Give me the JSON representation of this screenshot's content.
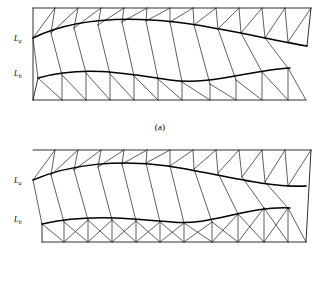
{
  "figure": {
    "panels": [
      {
        "id": "a",
        "caption": "(a)",
        "labels": {
          "upper": {
            "base": "L",
            "sub": "a",
            "text": "La"
          },
          "lower": {
            "base": "L",
            "sub": "b",
            "text": "Lb"
          }
        }
      },
      {
        "id": "b",
        "caption": "(b)",
        "labels": {
          "upper": {
            "base": "L",
            "sub": "a",
            "text": "La"
          },
          "lower": {
            "base": "L",
            "sub": "b",
            "text": "Lb"
          }
        }
      }
    ],
    "colors": {
      "background": "#ffffff",
      "line": "#1a1a1a",
      "curve": "#000000",
      "text": "#000000"
    }
  },
  "panel_a": {
    "outline": "M 33,8 L 311,8 L 307,46 L 306,100 L 33,100 Z",
    "top_boundary": "M 33,8 L 311,8",
    "right_upper": "M 311,8 L 307,46",
    "left_boundary": "M 33,8 L 33,100",
    "bottom_boundary": "M 33,100 L 306,100",
    "curve_a": "M 33,38 C 70,20 120,16 175,22 C 225,28 270,40 307,46",
    "curve_b": "M 38,78 C 80,66 120,72 170,80 C 210,86 250,70 290,68",
    "upper_strip_verticals": [
      "M 55,8 L 51,33",
      "M 78,8 L 74,28",
      "M 101,8 L 98,25",
      "M 124,8 L 122,22",
      "M 147,8 L 146,21",
      "M 170,8 L 170,22",
      "M 193,8 L 194,25",
      "M 216,8 L 218,29",
      "M 239,8 L 241,33",
      "M 262,8 L 265,38",
      "M 285,8 L 288,42"
    ],
    "upper_strip_diagonals": [
      "M 33,38 L 55,8",
      "M 51,33 L 78,8",
      "M 74,28 L 101,8",
      "M 98,25 L 124,8",
      "M 122,22 L 147,8",
      "M 146,21 L 170,8",
      "M 170,22 L 193,8",
      "M 194,25 L 216,8",
      "M 218,29 L 239,8",
      "M 241,33 L 262,8",
      "M 265,38 L 285,8",
      "M 288,42 L 311,8"
    ],
    "middle_band_lines": [
      "M 33,38 L 38,78",
      "M 51,33 L 62,75",
      "M 74,28 L 86,73",
      "M 98,25 L 110,74",
      "M 122,22 L 134,76",
      "M 146,21 L 158,79",
      "M 170,22 L 182,82",
      "M 194,25 L 210,84",
      "M 218,29 L 236,80",
      "M 241,33 L 262,72",
      "M 265,38 L 288,68",
      "M 288,42 L 307,46"
    ],
    "lower_strip_verticals": [
      "M 62,75 L 62,100",
      "M 86,73 L 86,100",
      "M 110,74 L 110,100",
      "M 134,76 L 134,100",
      "M 158,79 L 158,100",
      "M 182,82 L 182,100",
      "M 210,84 L 210,100",
      "M 236,80 L 236,100",
      "M 262,72 L 262,100",
      "M 288,68 L 288,100"
    ],
    "lower_strip_diagonals": [
      "M 38,78 L 62,100",
      "M 62,75 L 86,100",
      "M 86,73 L 110,100",
      "M 110,74 L 134,100",
      "M 134,76 L 158,100",
      "M 158,79 L 182,100",
      "M 182,82 L 210,100",
      "M 210,84 L 236,100",
      "M 236,80 L 262,100",
      "M 262,72 L 288,100",
      "M 288,68 L 306,100"
    ],
    "lower_left_closure": "M 33,100 L 38,78",
    "label_positions": {
      "upper": {
        "x": 14,
        "y": 41
      },
      "lower": {
        "x": 14,
        "y": 76
      }
    }
  },
  "panel_b": {
    "outline": "M 33,8 L 311,8 L 306,100 L 42,100 Z",
    "top_boundary": "M 33,8 L 311,8",
    "right_boundary": "M 311,8 L 306,100",
    "bottom_boundary": "M 42,100 L 306,100",
    "curve_a": "M 33,38 C 70,22 120,17 168,24 C 215,31 265,46 306,44",
    "curve_b": "M 42,82 C 85,72 125,76 172,80 C 212,84 245,64 290,66",
    "upper_strip_verticals": [
      "M 55,8 L 51,33",
      "M 78,8 L 74,28",
      "M 101,8 L 98,25",
      "M 124,8 L 122,22",
      "M 147,8 L 146,21",
      "M 170,8 L 170,24",
      "M 193,8 L 194,27",
      "M 216,8 L 218,31",
      "M 239,8 L 242,35",
      "M 262,8 L 265,40",
      "M 285,8 L 288,44"
    ],
    "upper_strip_diagonals": [
      "M 33,38 L 55,8",
      "M 51,33 L 78,8",
      "M 74,28 L 101,8",
      "M 98,25 L 124,8",
      "M 122,22 L 147,8",
      "M 146,21 L 170,8",
      "M 170,24 L 193,8",
      "M 194,27 L 216,8",
      "M 218,31 L 239,8",
      "M 242,35 L 262,8",
      "M 265,40 L 285,8",
      "M 288,44 L 311,8"
    ],
    "middle_band_lines": [
      "M 33,38 L 42,82",
      "M 51,33 L 64,80",
      "M 74,28 L 88,78",
      "M 98,25 L 112,78",
      "M 122,22 L 136,79",
      "M 146,21 L 160,80",
      "M 170,24 L 184,81",
      "M 194,27 L 212,80",
      "M 218,31 L 238,72",
      "M 242,35 L 264,66",
      "M 265,40 L 288,66",
      "M 288,44 L 306,44"
    ],
    "lower_strip_verticals": [
      "M 64,80 L 64,100",
      "M 88,78 L 88,100",
      "M 112,78 L 112,100",
      "M 136,79 L 136,100",
      "M 160,80 L 160,100",
      "M 184,81 L 184,100",
      "M 212,80 L 212,100",
      "M 238,72 L 238,100",
      "M 264,66 L 264,100",
      "M 288,66 L 288,100"
    ],
    "lower_strip_diagonals": [
      "M 42,82 L 64,100",
      "M 64,80 L 88,100",
      "M 88,78 L 112,100",
      "M 112,78 L 136,100",
      "M 136,79 L 160,100",
      "M 160,80 L 184,100",
      "M 184,81 L 212,100",
      "M 212,80 L 238,100",
      "M 238,72 L 264,100",
      "M 264,66 L 288,100",
      "M 288,66 L 306,100"
    ],
    "lower_extra_diagonals": [
      "M 64,100 L 88,78",
      "M 88,100 L 112,78",
      "M 112,100 L 136,79",
      "M 136,100 L 160,80",
      "M 160,100 L 184,81",
      "M 184,100 L 212,80",
      "M 212,100 L 238,72",
      "M 238,100 L 264,66",
      "M 264,100 L 288,66"
    ],
    "lower_left_closure": "M 42,100 L 42,82",
    "label_positions": {
      "upper": {
        "x": 14,
        "y": 41
      },
      "lower": {
        "x": 14,
        "y": 80
      }
    }
  }
}
